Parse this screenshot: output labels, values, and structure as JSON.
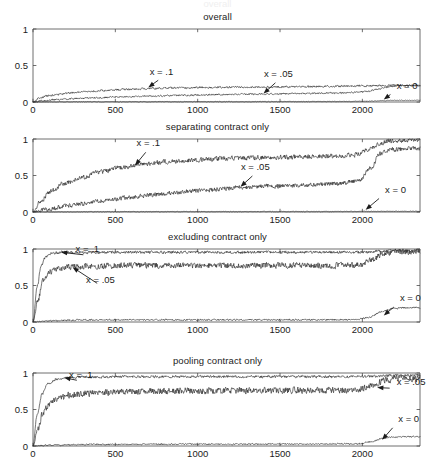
{
  "figure": {
    "width": 435,
    "height": 469,
    "background": "#ffffff",
    "ink_color": "#2b2b2b",
    "partial_top_text": "overall"
  },
  "chart_data": [
    {
      "type": "line",
      "title": "overall",
      "xlabel": "",
      "ylabel": "",
      "xlim": [
        0,
        2350
      ],
      "ylim": [
        0,
        1
      ],
      "xticks": [
        0,
        500,
        1000,
        1500,
        2000
      ],
      "xticklabels": [
        "0",
        "500",
        "1000",
        "1500",
        "2000"
      ],
      "yticks": [
        0,
        0.5,
        1
      ],
      "yticklabels": [
        "0",
        "0.5",
        "1"
      ],
      "grid": false,
      "legend": "inline-annotations",
      "annotations": [
        {
          "text": "x = .1",
          "x": 700,
          "y": 0.2,
          "label_x": 780,
          "label_y": 0.33
        },
        {
          "text": "x = .05",
          "x": 1400,
          "y": 0.115,
          "label_x": 1490,
          "label_y": 0.3
        },
        {
          "text": "x = 0",
          "x": 2130,
          "y": 0.035,
          "label_x": 2190,
          "label_y": 0.135
        }
      ],
      "series": [
        {
          "name": "x = .1",
          "noise": 0.012,
          "points": [
            [
              0,
              0.0
            ],
            [
              40,
              0.055
            ],
            [
              90,
              0.085
            ],
            [
              150,
              0.105
            ],
            [
              230,
              0.125
            ],
            [
              320,
              0.142
            ],
            [
              430,
              0.158
            ],
            [
              560,
              0.172
            ],
            [
              700,
              0.185
            ],
            [
              860,
              0.193
            ],
            [
              1050,
              0.199
            ],
            [
              1300,
              0.203
            ],
            [
              1550,
              0.208
            ],
            [
              1800,
              0.215
            ],
            [
              2000,
              0.22
            ],
            [
              2120,
              0.226
            ],
            [
              2200,
              0.229
            ],
            [
              2350,
              0.229
            ]
          ]
        },
        {
          "name": "x = .05",
          "noise": 0.01,
          "points": [
            [
              0,
              0.0
            ],
            [
              60,
              0.018
            ],
            [
              140,
              0.032
            ],
            [
              250,
              0.046
            ],
            [
              380,
              0.058
            ],
            [
              540,
              0.07
            ],
            [
              720,
              0.082
            ],
            [
              930,
              0.093
            ],
            [
              1150,
              0.102
            ],
            [
              1400,
              0.11
            ],
            [
              1650,
              0.117
            ],
            [
              1880,
              0.126
            ],
            [
              2020,
              0.14
            ],
            [
              2090,
              0.175
            ],
            [
              2150,
              0.205
            ],
            [
              2220,
              0.222
            ],
            [
              2350,
              0.226
            ]
          ]
        },
        {
          "name": "x = 0",
          "noise": 0.004,
          "points": [
            [
              0,
              0.0
            ],
            [
              400,
              0.003
            ],
            [
              900,
              0.004
            ],
            [
              1400,
              0.005
            ],
            [
              1800,
              0.006
            ],
            [
              1980,
              0.008
            ],
            [
              2060,
              0.012
            ],
            [
              2120,
              0.018
            ],
            [
              2180,
              0.022
            ],
            [
              2260,
              0.023
            ],
            [
              2350,
              0.023
            ]
          ]
        }
      ]
    },
    {
      "type": "line",
      "title": "separating contract only",
      "xlabel": "",
      "ylabel": "",
      "xlim": [
        0,
        2350
      ],
      "ylim": [
        0,
        1
      ],
      "xticks": [
        0,
        500,
        1000,
        1500,
        2000
      ],
      "xticklabels": [
        "0",
        "500",
        "1000",
        "1500",
        "2000"
      ],
      "yticks": [
        0,
        0.5,
        1
      ],
      "yticklabels": [
        "0",
        "0.5",
        "1"
      ],
      "grid": false,
      "legend": "inline-annotations",
      "annotations": [
        {
          "text": "x = .1",
          "x": 620,
          "y": 0.64,
          "label_x": 700,
          "label_y": 0.86
        },
        {
          "text": "x = .05",
          "x": 1260,
          "y": 0.345,
          "label_x": 1350,
          "label_y": 0.53
        },
        {
          "text": "x = 0",
          "x": 2020,
          "y": 0.03,
          "label_x": 2120,
          "label_y": 0.22
        }
      ],
      "series": [
        {
          "name": "x = .1",
          "noise": 0.03,
          "points": [
            [
              0,
              0.0
            ],
            [
              50,
              0.16
            ],
            [
              110,
              0.29
            ],
            [
              190,
              0.39
            ],
            [
              290,
              0.47
            ],
            [
              410,
              0.55
            ],
            [
              540,
              0.61
            ],
            [
              680,
              0.655
            ],
            [
              840,
              0.695
            ],
            [
              1000,
              0.715
            ],
            [
              1200,
              0.735
            ],
            [
              1400,
              0.745
            ],
            [
              1600,
              0.755
            ],
            [
              1800,
              0.765
            ],
            [
              1950,
              0.78
            ],
            [
              2040,
              0.85
            ],
            [
              2110,
              0.945
            ],
            [
              2180,
              0.975
            ],
            [
              2260,
              0.985
            ],
            [
              2350,
              0.985
            ]
          ]
        },
        {
          "name": "x = .05",
          "noise": 0.028,
          "points": [
            [
              0,
              0.0
            ],
            [
              80,
              0.035
            ],
            [
              180,
              0.075
            ],
            [
              300,
              0.115
            ],
            [
              430,
              0.155
            ],
            [
              570,
              0.195
            ],
            [
              720,
              0.235
            ],
            [
              880,
              0.27
            ],
            [
              1050,
              0.3
            ],
            [
              1250,
              0.335
            ],
            [
              1450,
              0.355
            ],
            [
              1650,
              0.365
            ],
            [
              1850,
              0.39
            ],
            [
              1980,
              0.43
            ],
            [
              2050,
              0.6
            ],
            [
              2110,
              0.8
            ],
            [
              2170,
              0.855
            ],
            [
              2260,
              0.865
            ],
            [
              2350,
              0.865
            ]
          ]
        },
        {
          "name": "x = 0",
          "noise": 0.004,
          "points": [
            [
              0,
              0.0
            ],
            [
              500,
              0.004
            ],
            [
              1100,
              0.005
            ],
            [
              1700,
              0.006
            ],
            [
              2000,
              0.008
            ],
            [
              2350,
              0.01
            ]
          ]
        }
      ]
    },
    {
      "type": "line",
      "title": "excluding contract only",
      "xlabel": "",
      "ylabel": "",
      "xlim": [
        0,
        2350
      ],
      "ylim": [
        0,
        1
      ],
      "xticks": [
        0,
        500,
        1000,
        1500,
        2000
      ],
      "xticklabels": [
        "0",
        "500",
        "1000",
        "1500",
        "2000"
      ],
      "yticks": [
        0,
        0.5,
        1
      ],
      "yticklabels": [
        "0",
        "0.5",
        "1"
      ],
      "grid": false,
      "legend": "inline-annotations",
      "annotations": [
        {
          "text": "x = .1",
          "x": 170,
          "y": 0.955,
          "label_x": 330,
          "label_y": 0.915
        },
        {
          "text": "x = .05",
          "x": 240,
          "y": 0.75,
          "label_x": 410,
          "label_y": 0.5
        },
        {
          "text": "x = 0",
          "x": 2130,
          "y": 0.09,
          "label_x": 2210,
          "label_y": 0.24
        }
      ],
      "series": [
        {
          "name": "x = .1",
          "noise": 0.018,
          "points": [
            [
              0,
              0.0
            ],
            [
              25,
              0.48
            ],
            [
              50,
              0.78
            ],
            [
              80,
              0.9
            ],
            [
              120,
              0.945
            ],
            [
              180,
              0.955
            ],
            [
              300,
              0.955
            ],
            [
              600,
              0.955
            ],
            [
              1000,
              0.955
            ],
            [
              1400,
              0.955
            ],
            [
              1800,
              0.955
            ],
            [
              2000,
              0.955
            ],
            [
              2080,
              0.965
            ],
            [
              2150,
              0.975
            ],
            [
              2250,
              0.978
            ],
            [
              2350,
              0.978
            ]
          ]
        },
        {
          "name": "x = .05",
          "noise": 0.038,
          "points": [
            [
              0,
              0.0
            ],
            [
              30,
              0.3
            ],
            [
              60,
              0.56
            ],
            [
              100,
              0.68
            ],
            [
              150,
              0.73
            ],
            [
              230,
              0.755
            ],
            [
              350,
              0.765
            ],
            [
              600,
              0.775
            ],
            [
              1000,
              0.775
            ],
            [
              1400,
              0.775
            ],
            [
              1800,
              0.775
            ],
            [
              1980,
              0.78
            ],
            [
              2060,
              0.85
            ],
            [
              2130,
              0.945
            ],
            [
              2220,
              0.965
            ],
            [
              2350,
              0.965
            ]
          ]
        },
        {
          "name": "x = 0",
          "noise": 0.01,
          "points": [
            [
              0,
              0.0
            ],
            [
              100,
              0.015
            ],
            [
              300,
              0.028
            ],
            [
              700,
              0.03
            ],
            [
              1200,
              0.03
            ],
            [
              1700,
              0.03
            ],
            [
              1950,
              0.032
            ],
            [
              2040,
              0.06
            ],
            [
              2110,
              0.135
            ],
            [
              2180,
              0.185
            ],
            [
              2260,
              0.196
            ],
            [
              2350,
              0.198
            ]
          ]
        }
      ]
    },
    {
      "type": "line",
      "title": "pooling contract only",
      "xlabel": "",
      "ylabel": "",
      "xlim": [
        0,
        2350
      ],
      "ylim": [
        0,
        1
      ],
      "xticks": [
        0,
        500,
        1000,
        1500,
        2000
      ],
      "xticklabels": [
        "0",
        "500",
        "1000",
        "1500",
        "2000"
      ],
      "yticks": [
        0,
        0.5,
        1
      ],
      "yticklabels": [
        "0",
        "0.5",
        "1"
      ],
      "grid": false,
      "legend": "inline-annotations",
      "annotations": [
        {
          "text": "x = .1",
          "x": 190,
          "y": 0.935,
          "label_x": 290,
          "label_y": 0.89
        },
        {
          "text": "x = .05",
          "x": 2090,
          "y": 0.8,
          "label_x": 2190,
          "label_y": 0.79
        },
        {
          "text": "x = 0",
          "x": 2120,
          "y": 0.085,
          "label_x": 2200,
          "label_y": 0.29
        }
      ],
      "series": [
        {
          "name": "x = .1",
          "noise": 0.016,
          "points": [
            [
              0,
              0.0
            ],
            [
              25,
              0.43
            ],
            [
              55,
              0.71
            ],
            [
              90,
              0.855
            ],
            [
              140,
              0.915
            ],
            [
              200,
              0.935
            ],
            [
              330,
              0.945
            ],
            [
              700,
              0.95
            ],
            [
              1200,
              0.95
            ],
            [
              1700,
              0.95
            ],
            [
              2000,
              0.95
            ],
            [
              2080,
              0.955
            ],
            [
              2160,
              0.965
            ],
            [
              2260,
              0.968
            ],
            [
              2350,
              0.968
            ]
          ]
        },
        {
          "name": "x = .05",
          "noise": 0.042,
          "points": [
            [
              0,
              0.0
            ],
            [
              30,
              0.24
            ],
            [
              60,
              0.45
            ],
            [
              100,
              0.58
            ],
            [
              150,
              0.645
            ],
            [
              230,
              0.7
            ],
            [
              340,
              0.725
            ],
            [
              600,
              0.745
            ],
            [
              1000,
              0.755
            ],
            [
              1400,
              0.76
            ],
            [
              1800,
              0.765
            ],
            [
              1980,
              0.775
            ],
            [
              2060,
              0.83
            ],
            [
              2130,
              0.9
            ],
            [
              2220,
              0.925
            ],
            [
              2350,
              0.925
            ]
          ]
        },
        {
          "name": "x = 0",
          "noise": 0.009,
          "points": [
            [
              0,
              0.0
            ],
            [
              120,
              0.012
            ],
            [
              350,
              0.022
            ],
            [
              800,
              0.025
            ],
            [
              1300,
              0.026
            ],
            [
              1800,
              0.027
            ],
            [
              1980,
              0.03
            ],
            [
              2050,
              0.055
            ],
            [
              2120,
              0.105
            ],
            [
              2190,
              0.125
            ],
            [
              2280,
              0.128
            ],
            [
              2350,
              0.128
            ]
          ]
        }
      ]
    }
  ],
  "panel_geometry": [
    {
      "title_y": 11,
      "plot_top": 29,
      "plot_bottom": 102
    },
    {
      "title_y": 121,
      "plot_top": 139,
      "plot_bottom": 212
    },
    {
      "title_y": 231,
      "plot_top": 249,
      "plot_bottom": 322
    },
    {
      "title_y": 355,
      "plot_top": 373,
      "plot_bottom": 446
    }
  ],
  "plot_left": 33,
  "plot_right": 420
}
